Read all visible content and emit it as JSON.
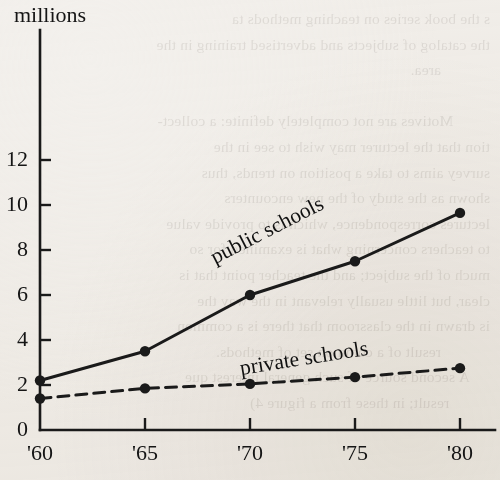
{
  "background": {
    "paper_color": "#f5f3f0",
    "ink_color": "#1a1a1a",
    "showthrough_text": "s the book series on teaching methods ta\nthe catalog of subjects and advertised training in the\n            area.\n\n         Motives are not completely definite: a collect-\ntion that the lecturer may wish to see in the\nsurvey aims to take a position on trends, thus\nshown as the study of the new encounters\nlectures correspondence, which is to provide value\nto teachers concerning what is examined for so\nmuch of the subject; and the teacher point that is\nclear, but little usually relevant in the way the\nis drawn in the classroom that there is a common\n            result of a common set of methods.\n     A second source of such general interest que\n          result; in these from a figure 4)"
  },
  "chart_data": {
    "type": "line",
    "title": "",
    "xlabel": "",
    "ylabel": "millions",
    "ylabel_text": "millions",
    "x": [
      "'60",
      "'65",
      "'70",
      "'75",
      "'80"
    ],
    "x_tick_labels": [
      "'60",
      "'65",
      "'70",
      "'75",
      "'80"
    ],
    "y_tick_labels": [
      "0",
      "2",
      "4",
      "6",
      "8",
      "10",
      "12"
    ],
    "y_ticks": [
      0,
      2,
      4,
      6,
      8,
      10,
      12
    ],
    "xlim": [
      1960,
      1980
    ],
    "ylim": [
      0,
      13
    ],
    "grid": false,
    "legend_position": "inline-annotation",
    "series": [
      {
        "name": "public schools",
        "label": "public schools",
        "style": "solid",
        "marker": "filled-circle",
        "color": "#1a1a1a",
        "values": [
          2.2,
          3.5,
          6.0,
          7.5,
          9.65
        ],
        "label_rotation_deg": -27
      },
      {
        "name": "private schools",
        "label": "private schools",
        "style": "dashed",
        "marker": "filled-circle",
        "color": "#1a1a1a",
        "values": [
          1.4,
          1.85,
          2.05,
          2.35,
          2.75
        ],
        "label_rotation_deg": -9
      }
    ]
  },
  "geometry": {
    "origin_x": 40,
    "origin_y": 430,
    "x_step_px": 105,
    "y_unit_px": 22.5,
    "axis_top_y": 30,
    "axis_right_x": 495
  }
}
